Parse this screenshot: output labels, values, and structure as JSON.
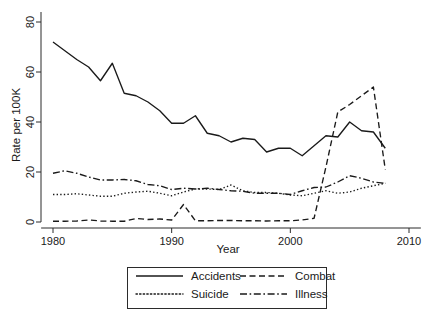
{
  "chart_data": {
    "type": "line",
    "title": "",
    "xlabel": "Year",
    "ylabel": "Rate per 100K",
    "xlim": [
      1979,
      2011
    ],
    "ylim": [
      0,
      84
    ],
    "xticks": [
      1980,
      1990,
      2000,
      2010
    ],
    "yticks": [
      0,
      20,
      40,
      60,
      80
    ],
    "grid": false,
    "legend_position": "below-axes",
    "x": [
      1980,
      1981,
      1982,
      1983,
      1984,
      1985,
      1986,
      1987,
      1988,
      1989,
      1990,
      1991,
      1992,
      1993,
      1994,
      1995,
      1996,
      1997,
      1998,
      1999,
      2000,
      2001,
      2002,
      2003,
      2004,
      2005,
      2006,
      2007,
      2008
    ],
    "series": [
      {
        "name": "Accidents",
        "style": "solid",
        "values": [
          72.0,
          68.5,
          65.0,
          62.0,
          56.5,
          63.5,
          51.5,
          50.5,
          48.0,
          44.5,
          39.5,
          39.5,
          42.5,
          35.5,
          34.5,
          32.0,
          33.5,
          33.0,
          28.0,
          29.5,
          29.5,
          26.5,
          30.5,
          34.5,
          34.0,
          40.0,
          36.5,
          36.0,
          29.5
        ]
      },
      {
        "name": "Combat",
        "style": "dashed",
        "values": [
          0.3,
          0.3,
          0.4,
          0.8,
          0.4,
          0.3,
          0.3,
          1.4,
          1.0,
          1.2,
          0.8,
          7.0,
          0.5,
          0.5,
          0.6,
          0.6,
          0.5,
          0.5,
          0.4,
          0.5,
          0.5,
          0.8,
          1.5,
          22.0,
          44.0,
          47.0,
          50.5,
          54.0,
          21.0
        ]
      },
      {
        "name": "Suicide",
        "style": "dotted",
        "values": [
          11.0,
          11.0,
          11.3,
          10.8,
          10.3,
          10.3,
          11.5,
          12.0,
          12.3,
          11.5,
          10.5,
          12.0,
          13.2,
          13.2,
          13.0,
          14.8,
          12.5,
          11.8,
          11.8,
          11.5,
          10.8,
          10.5,
          11.5,
          12.5,
          11.5,
          12.0,
          13.5,
          14.5,
          15.5
        ]
      },
      {
        "name": "Illness",
        "style": "dashdot",
        "values": [
          19.5,
          20.5,
          19.5,
          18.0,
          16.8,
          16.8,
          17.0,
          16.5,
          15.0,
          14.5,
          13.0,
          13.5,
          13.2,
          13.5,
          13.0,
          12.5,
          12.3,
          11.5,
          11.5,
          11.5,
          11.0,
          12.5,
          13.8,
          14.0,
          16.0,
          18.5,
          17.5,
          16.0,
          15.5
        ]
      }
    ],
    "legend": [
      {
        "label": "Accidents",
        "style": "solid"
      },
      {
        "label": "Combat",
        "style": "dashed"
      },
      {
        "label": "Suicide",
        "style": "dotted"
      },
      {
        "label": "Illness",
        "style": "dashdot"
      }
    ]
  },
  "axis": {
    "y_tick_labels": [
      "0",
      "20",
      "40",
      "60",
      "80"
    ],
    "x_tick_labels": [
      "1980",
      "1990",
      "2000",
      "2010"
    ],
    "x_title": "Year",
    "y_title": "Rate per 100K"
  }
}
